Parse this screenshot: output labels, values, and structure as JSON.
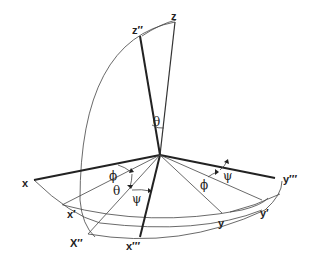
{
  "diagram": {
    "axis_labels": {
      "z": "z",
      "z_double_prime": "z′′",
      "x": "x",
      "x_prime": "x′",
      "x_double_prime": "X′′",
      "x_triple_prime": "x′′′",
      "y": "y",
      "y_prime": "y′",
      "y_triple_prime": "y′′′"
    },
    "angle_labels": {
      "theta_top": "θ",
      "phi_left": "ϕ",
      "theta_left": "θ",
      "psi_left": "ψ",
      "psi_right": "ψ",
      "phi_right": "ϕ"
    },
    "colors": {
      "line": "#222222",
      "background": "#ffffff"
    }
  }
}
